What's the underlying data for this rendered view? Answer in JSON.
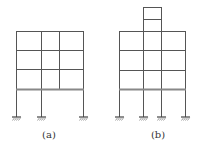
{
  "colors": {
    "line": "#555555",
    "thick_beam": "#888888",
    "background": "#ffffff",
    "caption": "#333333"
  },
  "figures": [
    {
      "id": "a",
      "caption": "(a)",
      "caption_pos": {
        "x": 49,
        "y": 130
      },
      "columns": [
        {
          "x": 16,
          "y1": 31,
          "y2": 117
        },
        {
          "x": 41,
          "y1": 31,
          "y2": 117
        },
        {
          "x": 59,
          "y1": 31,
          "y2": 89
        },
        {
          "x": 83,
          "y1": 31,
          "y2": 117
        }
      ],
      "beams": [
        {
          "x1": 16,
          "x2": 83,
          "y": 31,
          "thick": false
        },
        {
          "x1": 16,
          "x2": 83,
          "y": 50,
          "thick": false
        },
        {
          "x1": 16,
          "x2": 83,
          "y": 69,
          "thick": false
        },
        {
          "x1": 16,
          "x2": 83,
          "y": 89,
          "thick": true
        }
      ],
      "supports": [
        {
          "x": 16,
          "y": 117
        },
        {
          "x": 41,
          "y": 117
        },
        {
          "x": 83,
          "y": 117
        }
      ]
    },
    {
      "id": "b",
      "caption": "(b)",
      "caption_pos": {
        "x": 158,
        "y": 130
      },
      "columns": [
        {
          "x": 119,
          "y1": 31,
          "y2": 117
        },
        {
          "x": 143,
          "y1": 7,
          "y2": 117
        },
        {
          "x": 161,
          "y1": 7,
          "y2": 117
        },
        {
          "x": 185,
          "y1": 31,
          "y2": 117
        }
      ],
      "beams": [
        {
          "x1": 143,
          "x2": 161,
          "y": 7,
          "thick": false
        },
        {
          "x1": 143,
          "x2": 161,
          "y": 19,
          "thick": false
        },
        {
          "x1": 119,
          "x2": 185,
          "y": 31,
          "thick": false
        },
        {
          "x1": 119,
          "x2": 185,
          "y": 50,
          "thick": false
        },
        {
          "x1": 119,
          "x2": 185,
          "y": 70,
          "thick": false
        },
        {
          "x1": 119,
          "x2": 185,
          "y": 89,
          "thick": true
        }
      ],
      "supports": [
        {
          "x": 119,
          "y": 117
        },
        {
          "x": 143,
          "y": 117
        },
        {
          "x": 161,
          "y": 117
        },
        {
          "x": 185,
          "y": 117
        }
      ]
    }
  ]
}
